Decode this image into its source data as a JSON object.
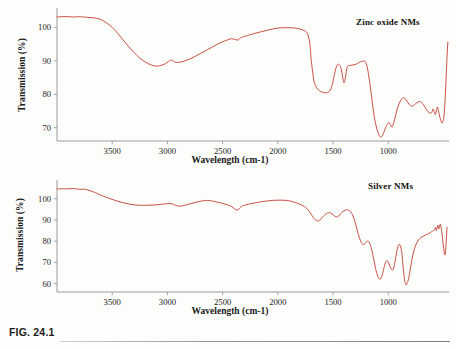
{
  "figure": {
    "caption": "FIG. 24.1"
  },
  "charts": [
    {
      "id": "zinc-oxide-nms",
      "title": "Zinc oxide NMs",
      "xlabel": "Wavelength (cm-1)",
      "ylabel": "Transmission (%)",
      "color": "#c6453a"
    },
    {
      "id": "silver-nms",
      "title": "Silver NMs",
      "xlabel": "Wavelength (cm-1)",
      "ylabel": "Transmission (%)",
      "color": "#c6453a"
    }
  ],
  "chart_data": [
    {
      "type": "line",
      "id": "zinc-oxide-nms",
      "title": "Zinc oxide NMs",
      "xlabel": "Wavelength (cm-1)",
      "ylabel": "Transmission (%)",
      "xlim": [
        4000,
        450
      ],
      "ylim": [
        66,
        104
      ],
      "xticks": [
        3500,
        3000,
        2500,
        2000,
        1500,
        1000
      ],
      "yticks": [
        70,
        80,
        90,
        100
      ],
      "grid": false,
      "legend_position": "top-right",
      "xaxis_direction": "reversed",
      "series": [
        {
          "name": "Zinc oxide NMs",
          "color": "#c6453a",
          "x": [
            4000,
            3950,
            3900,
            3850,
            3800,
            3760,
            3720,
            3680,
            3640,
            3600,
            3550,
            3500,
            3450,
            3400,
            3350,
            3300,
            3250,
            3200,
            3150,
            3100,
            3060,
            3020,
            2990,
            2960,
            2930,
            2900,
            2850,
            2800,
            2750,
            2700,
            2650,
            2600,
            2550,
            2500,
            2450,
            2420,
            2390,
            2360,
            2340,
            2320,
            2300,
            2250,
            2200,
            2150,
            2100,
            2050,
            2000,
            1950,
            1900,
            1850,
            1800,
            1760,
            1730,
            1710,
            1700,
            1690,
            1680,
            1670,
            1650,
            1630,
            1610,
            1590,
            1570,
            1550,
            1530,
            1510,
            1490,
            1470,
            1450,
            1430,
            1420,
            1410,
            1400,
            1390,
            1380,
            1370,
            1350,
            1330,
            1310,
            1290,
            1270,
            1250,
            1230,
            1210,
            1190,
            1170,
            1150,
            1130,
            1110,
            1090,
            1070,
            1050,
            1030,
            1010,
            995,
            980,
            965,
            950,
            935,
            920,
            900,
            880,
            860,
            840,
            820,
            800,
            780,
            760,
            740,
            720,
            700,
            680,
            660,
            640,
            620,
            605,
            595,
            585,
            575,
            565,
            555,
            545,
            535,
            525,
            515,
            505,
            495,
            488,
            482,
            476,
            470,
            465,
            460,
            455,
            452
          ],
          "y": [
            103.1,
            103.2,
            103.2,
            103.1,
            103.2,
            103.1,
            103.0,
            102.9,
            102.7,
            102.3,
            101.3,
            100.0,
            98.2,
            96.2,
            94.2,
            92.4,
            90.8,
            89.6,
            88.8,
            88.4,
            88.6,
            89.1,
            89.8,
            90.2,
            89.6,
            89.5,
            89.9,
            90.5,
            91.3,
            92.2,
            93.1,
            94.0,
            94.9,
            95.7,
            96.3,
            96.6,
            96.4,
            96.2,
            96.8,
            97.1,
            97.3,
            97.8,
            98.3,
            98.7,
            99.1,
            99.5,
            99.8,
            99.9,
            99.9,
            99.8,
            99.5,
            99.0,
            98.0,
            95.0,
            91.0,
            88.0,
            85.5,
            83.5,
            82.0,
            81.2,
            80.8,
            80.5,
            80.4,
            80.5,
            81.0,
            82.5,
            85.5,
            88.2,
            89.0,
            88.0,
            86.5,
            84.5,
            83.4,
            84.6,
            86.8,
            88.3,
            88.6,
            88.7,
            88.8,
            89.0,
            89.4,
            89.7,
            89.9,
            89.8,
            88.0,
            84.0,
            79.0,
            74.0,
            70.5,
            68.3,
            67.2,
            67.8,
            69.5,
            71.0,
            71.5,
            70.9,
            70.2,
            71.5,
            73.5,
            75.5,
            77.3,
            78.5,
            79.0,
            78.4,
            77.4,
            76.6,
            76.4,
            76.9,
            77.5,
            77.8,
            77.6,
            76.8,
            75.7,
            74.8,
            74.3,
            74.6,
            75.6,
            74.8,
            73.9,
            75.0,
            76.2,
            75.0,
            73.4,
            72.3,
            71.4,
            71.8,
            73.5,
            76.5,
            80.5,
            85.0,
            89.5,
            93.0,
            95.6,
            97.0
          ]
        }
      ]
    },
    {
      "type": "line",
      "id": "silver-nms",
      "title": "Silver NMs",
      "xlabel": "Wavelength (cm-1)",
      "ylabel": "Transmission (%)",
      "xlim": [
        4000,
        450
      ],
      "ylim": [
        56,
        106
      ],
      "xticks": [
        3500,
        3000,
        2500,
        2000,
        1500,
        1000
      ],
      "yticks": [
        60,
        70,
        80,
        90,
        100
      ],
      "grid": false,
      "legend_position": "top-right",
      "xaxis_direction": "reversed",
      "series": [
        {
          "name": "Silver NMs",
          "color": "#c6453a",
          "x": [
            4000,
            3950,
            3900,
            3860,
            3820,
            3780,
            3750,
            3720,
            3690,
            3660,
            3630,
            3600,
            3550,
            3500,
            3450,
            3400,
            3350,
            3300,
            3250,
            3200,
            3150,
            3100,
            3050,
            3000,
            2960,
            2930,
            2900,
            2870,
            2840,
            2800,
            2760,
            2720,
            2680,
            2650,
            2620,
            2580,
            2540,
            2500,
            2460,
            2420,
            2390,
            2370,
            2350,
            2330,
            2310,
            2280,
            2250,
            2200,
            2150,
            2100,
            2050,
            2000,
            1960,
            1920,
            1880,
            1840,
            1800,
            1770,
            1750,
            1730,
            1710,
            1690,
            1670,
            1650,
            1630,
            1610,
            1590,
            1570,
            1550,
            1530,
            1510,
            1490,
            1470,
            1450,
            1430,
            1410,
            1390,
            1370,
            1350,
            1330,
            1310,
            1290,
            1270,
            1250,
            1230,
            1210,
            1190,
            1170,
            1150,
            1130,
            1110,
            1090,
            1075,
            1060,
            1045,
            1030,
            1015,
            1000,
            985,
            970,
            955,
            940,
            925,
            910,
            895,
            880,
            870,
            860,
            850,
            840,
            830,
            815,
            800,
            785,
            770,
            755,
            740,
            725,
            710,
            695,
            680,
            665,
            650,
            635,
            620,
            610,
            600,
            590,
            580,
            572,
            565,
            558,
            550,
            542,
            535,
            528,
            520,
            512,
            505,
            498,
            492,
            486,
            480,
            474,
            468,
            462,
            456,
            452
          ],
          "y": [
            104.6,
            104.7,
            104.7,
            104.8,
            104.6,
            104.4,
            104.5,
            104.1,
            103.6,
            103.0,
            102.3,
            101.6,
            100.6,
            99.7,
            98.8,
            98.1,
            97.5,
            97.1,
            96.9,
            96.9,
            97.0,
            97.1,
            97.4,
            97.7,
            97.6,
            97.0,
            96.5,
            96.6,
            97.0,
            97.5,
            98.1,
            98.6,
            99.0,
            99.2,
            99.1,
            98.8,
            98.3,
            97.8,
            97.2,
            96.3,
            95.2,
            94.6,
            95.3,
            96.3,
            96.8,
            97.2,
            97.6,
            98.1,
            98.6,
            98.9,
            99.2,
            99.3,
            99.3,
            99.2,
            98.8,
            98.2,
            97.4,
            96.6,
            96.0,
            95.0,
            93.6,
            92.0,
            90.6,
            89.7,
            89.6,
            90.4,
            91.6,
            92.6,
            93.2,
            93.4,
            92.9,
            92.0,
            91.4,
            91.8,
            93.0,
            94.0,
            94.6,
            94.8,
            94.3,
            93.0,
            90.5,
            87.0,
            83.0,
            80.0,
            78.4,
            78.9,
            80.0,
            79.2,
            76.0,
            71.0,
            66.0,
            62.8,
            62.0,
            63.2,
            66.0,
            69.2,
            70.8,
            70.0,
            68.2,
            66.6,
            66.8,
            70.0,
            74.5,
            77.8,
            78.3,
            75.5,
            70.5,
            65.0,
            61.0,
            59.4,
            60.0,
            62.5,
            67.0,
            71.5,
            75.0,
            77.6,
            79.4,
            80.6,
            81.4,
            82.0,
            82.4,
            82.8,
            83.2,
            83.6,
            84.0,
            84.4,
            84.6,
            85.0,
            85.6,
            86.4,
            84.9,
            86.2,
            87.6,
            85.8,
            87.2,
            88.0,
            86.0,
            83.0,
            79.5,
            76.5,
            74.3,
            73.5,
            76.0,
            81.0,
            86.5,
            91.5
          ]
        }
      ]
    }
  ]
}
